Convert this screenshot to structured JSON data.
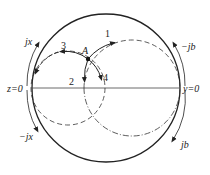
{
  "diagram": {
    "type": "smith-chart-admittance-impedance",
    "colors": {
      "stroke": "#222222",
      "dashed": "#333333",
      "background": "#ffffff"
    },
    "outer_circle": {
      "cx": 106,
      "cy": 88,
      "r": 74
    },
    "real_axis": {
      "x1": 32,
      "x2": 180,
      "y": 88
    },
    "constant_r_circle": {
      "cx": 68,
      "cy": 88,
      "r": 37,
      "style": "dashed"
    },
    "constant_g_circle": {
      "cx": 132,
      "cy": 88,
      "r": 48,
      "style": "dashed-upper / dash-dot-lower"
    },
    "point": {
      "label": "A",
      "x": 88,
      "y": 59
    },
    "labels": {
      "point_a": "A",
      "arrow_1": "1",
      "arrow_2": "2",
      "arrow_3": "3",
      "arrow_4": "4",
      "z_zero": "z=0",
      "y_zero": "y=0",
      "plus_jx": "jx",
      "minus_jx": "−jx",
      "minus_jb": "−jb",
      "plus_jb": "jb"
    },
    "arrows": [
      {
        "id": "1",
        "path": "along constant-g circle clockwise (upward-right)"
      },
      {
        "id": "2",
        "path": "along constant-g circle downward"
      },
      {
        "id": "3",
        "path": "along constant-r circle counterclockwise (leftward)"
      },
      {
        "id": "4",
        "path": "along constant-r circle downward-right"
      }
    ]
  }
}
